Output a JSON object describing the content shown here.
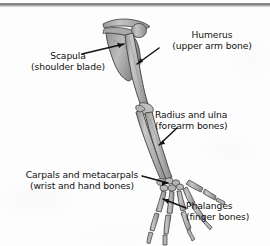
{
  "figure": {
    "background_color": "#fdfdfd",
    "text_color": "#111111",
    "bone_fill": "#b9b9b9",
    "bone_outline": "#4a4a4a",
    "leader_line_color": "#121212"
  },
  "labels": {
    "scapula": {
      "line1": "Scapula",
      "line2": "(shoulder blade)"
    },
    "humerus": {
      "line1": "Humerus",
      "line2": "(upper arm bone)"
    },
    "radius_ulna": {
      "line1": "Radius and ulna",
      "line2": "(forearm bones)"
    },
    "carpals_metacarpals": {
      "line1": "Carpals and metacarpals",
      "line2": "(wrist and hand bones)"
    },
    "phalanges": {
      "line1": "Phalanges",
      "line2": "(finger bones)"
    }
  },
  "bone_parts": [
    "clavicle",
    "scapula",
    "humerus",
    "radius",
    "ulna",
    "carpals",
    "metacarpals",
    "phalanges"
  ]
}
